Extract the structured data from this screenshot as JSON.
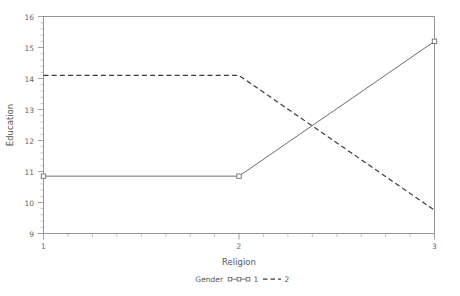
{
  "chart_data": {
    "type": "line",
    "title": "",
    "xlabel": "Religion",
    "ylabel": "Education",
    "x": [
      1,
      2,
      3
    ],
    "xlim": [
      1,
      3
    ],
    "ylim": [
      9,
      16
    ],
    "xticks": [
      "1",
      "2",
      "3"
    ],
    "yticks": [
      "9",
      "10",
      "11",
      "12",
      "13",
      "14",
      "15",
      "16"
    ],
    "grid": false,
    "legend_position": "bottom",
    "legend_title": "Gender",
    "series": [
      {
        "name": "1",
        "style": "solid-with-open-square-markers",
        "values": [
          10.85,
          10.85,
          15.2
        ]
      },
      {
        "name": "2",
        "style": "dashed",
        "values": [
          14.1,
          14.1,
          9.75
        ]
      }
    ]
  },
  "axes": {
    "y_title": "Education",
    "x_title": "Religion",
    "y_tick_labels": [
      "16",
      "15",
      "14",
      "13",
      "12",
      "11",
      "10",
      "9"
    ],
    "x_tick_labels": [
      "1",
      "2",
      "3"
    ]
  },
  "legend": {
    "title": "Gender",
    "entry_1_label": "1",
    "entry_2_label": "2"
  }
}
